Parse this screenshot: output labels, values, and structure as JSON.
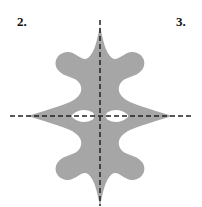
{
  "labels": {
    "left": "2.",
    "right": "3."
  },
  "colors": {
    "shape": "#a6a6a6",
    "axes": "#222222",
    "background": "#ffffff"
  },
  "figure": {
    "axes": [
      "vertical-dashed",
      "horizontal-dashed"
    ]
  }
}
